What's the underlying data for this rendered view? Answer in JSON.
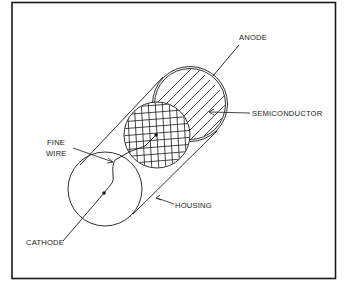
{
  "figure": {
    "type": "technical-diagram",
    "colors": {
      "ink": "#1a1a1a",
      "background": "#ffffff"
    }
  },
  "labels": {
    "anode": "ANODE",
    "semiconductor": "SEMICONDUCTOR",
    "fine_wire_line1": "FINE",
    "fine_wire_line2": "WIRE",
    "housing": "HOUSING",
    "cathode": "CATHODE"
  }
}
